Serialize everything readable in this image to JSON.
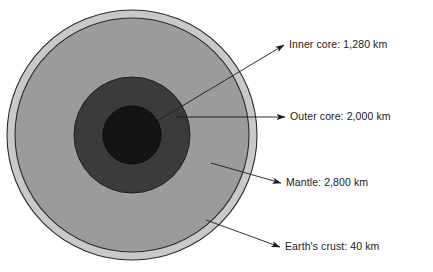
{
  "diagram": {
    "type": "cross-section-diagram",
    "background_color": "#ffffff",
    "center": {
      "x": 132,
      "y": 135
    },
    "layers": [
      {
        "key": "crust",
        "name": "Earth's crust",
        "thickness_km": 40,
        "label": "Earth's crust: 40 km",
        "fill": "#c9c9c9",
        "stroke": "#2b2b2b",
        "radius_px": 125
      },
      {
        "key": "mantle",
        "name": "Mantle",
        "thickness_km": 2800,
        "label": "Mantle: 2,800 km",
        "fill": "#9b9b9b",
        "stroke": "#2b2b2b",
        "radius_px": 117
      },
      {
        "key": "outer_core",
        "name": "Outer core",
        "thickness_km": 2000,
        "label": "Outer core: 2,000 km",
        "fill": "#3b3b3b",
        "stroke": "#1f1f1f",
        "radius_px": 58
      },
      {
        "key": "inner_core",
        "name": "Inner core",
        "thickness_km": 1280,
        "label": "Inner core: 1,280 km",
        "fill": "#141414",
        "stroke": "#0a0a0a",
        "radius_px": 29
      }
    ],
    "callouts": [
      {
        "key": "inner_core",
        "label": "Inner core: 1,280 km",
        "text_x": 289,
        "text_y": 45,
        "line_start_x": 152,
        "line_start_y": 124,
        "line_end_x": 284,
        "line_end_y": 45
      },
      {
        "key": "outer_core",
        "label": "Outer core: 2,000 km",
        "text_x": 290,
        "text_y": 117,
        "line_start_x": 176,
        "line_start_y": 117,
        "line_end_x": 285,
        "line_end_y": 117
      },
      {
        "key": "mantle",
        "label": "Mantle: 2,800 km",
        "text_x": 286,
        "text_y": 183,
        "line_start_x": 211,
        "line_start_y": 163,
        "line_end_x": 281,
        "line_end_y": 183
      },
      {
        "key": "crust",
        "label": "Earth's crust: 40 km",
        "text_x": 285,
        "text_y": 247,
        "line_start_x": 206,
        "line_start_y": 220,
        "line_end_x": 280,
        "line_end_y": 247
      }
    ],
    "arrow_color": "#1a1a1a",
    "leader_color": "#1a1a1a"
  }
}
